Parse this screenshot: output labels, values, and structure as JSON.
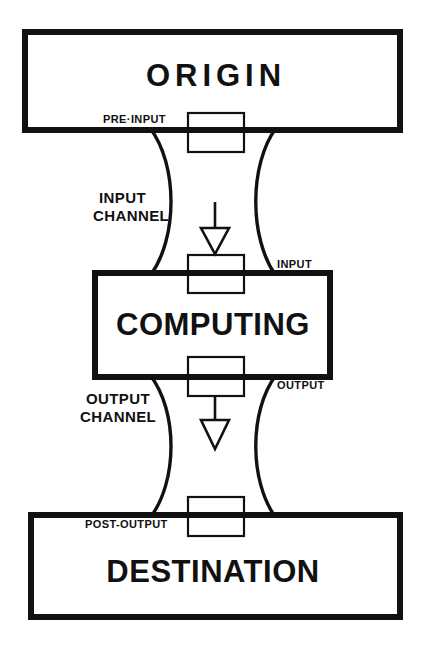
{
  "diagram": {
    "background_color": "#ffffff",
    "line_color": "#111111",
    "blocks": [
      {
        "id": "origin",
        "label": "ORIGIN"
      },
      {
        "id": "computing",
        "label": "COMPUTING"
      },
      {
        "id": "destination",
        "label": "DESTINATION"
      }
    ],
    "gate_labels": [
      {
        "id": "pre-input",
        "label": "PRE·INPUT"
      },
      {
        "id": "input",
        "label": "INPUT"
      },
      {
        "id": "output",
        "label": "OUTPUT"
      },
      {
        "id": "post-output",
        "label": "POST-OUTPUT"
      }
    ],
    "channels": [
      {
        "id": "input-channel",
        "line1": "INPUT",
        "line2": "CHANNEL"
      },
      {
        "id": "output-channel",
        "line1": "OUTPUT",
        "line2": "CHANNEL"
      }
    ],
    "arrows": [
      {
        "id": "input-flow-arrow",
        "direction": "down"
      },
      {
        "id": "output-flow-arrow",
        "direction": "down"
      }
    ]
  }
}
